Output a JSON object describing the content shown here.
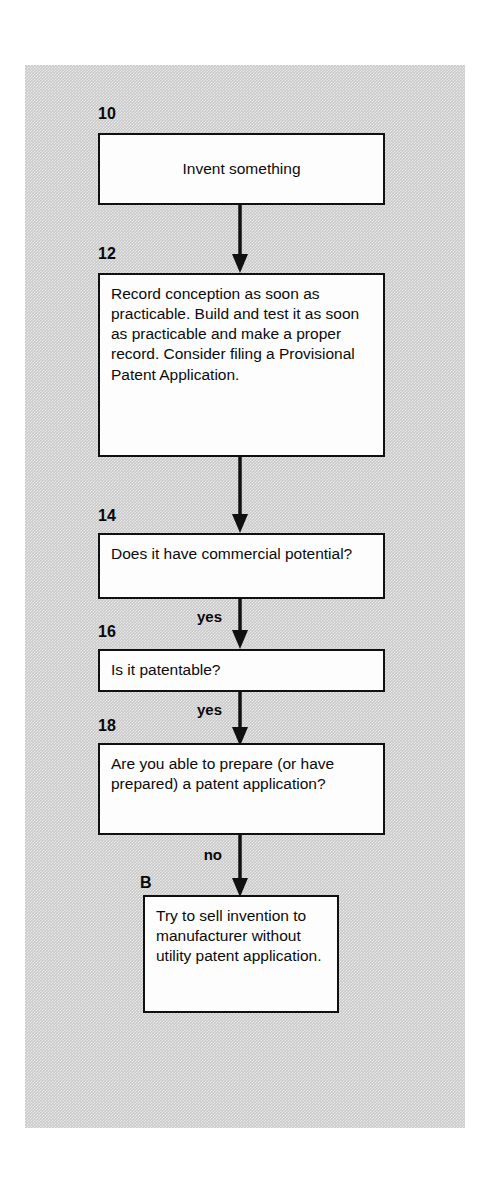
{
  "figure": {
    "panel_color": "#c9c9c9",
    "line_color": "#101010",
    "box_fill": "#fdfdfd"
  },
  "nodes": [
    {
      "ref": "10",
      "text": "Invent something",
      "shape": "process"
    },
    {
      "ref": "12",
      "text": "Record conception as soon as practicable. Build and test it as soon as practicable and make a proper record. Consider filing a Provisional Patent Application.",
      "shape": "process"
    },
    {
      "ref": "14",
      "text": "Does it have commercial potential?",
      "shape": "decision"
    },
    {
      "ref": "16",
      "text": "Is it patentable?",
      "shape": "decision"
    },
    {
      "ref": "18",
      "text": "Are you able to prepare (or have prepared) a patent application?",
      "shape": "decision"
    },
    {
      "ref": "B",
      "text": "Try to sell invention to manufacturer without utility patent application.",
      "shape": "process"
    }
  ],
  "edges": [
    {
      "from": "10",
      "to": "12",
      "label": ""
    },
    {
      "from": "12",
      "to": "14",
      "label": ""
    },
    {
      "from": "14",
      "to": "16",
      "label": "yes"
    },
    {
      "from": "16",
      "to": "18",
      "label": "yes"
    },
    {
      "from": "18",
      "to": "B",
      "label": "no"
    }
  ]
}
